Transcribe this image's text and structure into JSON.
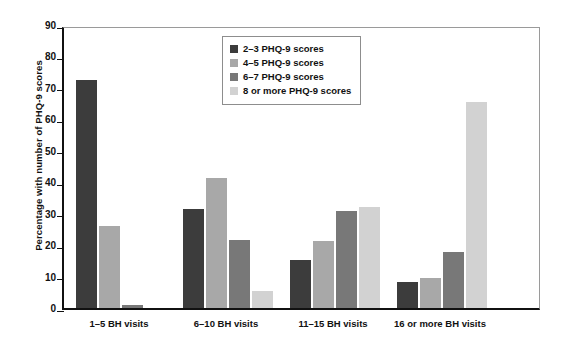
{
  "chart_data": {
    "type": "bar",
    "title": "",
    "xlabel": "",
    "ylabel": "Percentage with number of PHQ-9 scores",
    "ylim": [
      0,
      90
    ],
    "ytick_step": 10,
    "yticks": [
      "0",
      "10",
      "20",
      "30",
      "40",
      "50",
      "60",
      "70",
      "80",
      "90"
    ],
    "grid": false,
    "legend_position": "top-center",
    "categories": [
      "1–5 BH visits",
      "6–10 BH visits",
      "11–15 BH visits",
      "16 or more BH visits"
    ],
    "series": [
      {
        "name": "2–3 PHQ-9 scores",
        "color": "#3c3c3c",
        "values": [
          72.5,
          31.5,
          15.3,
          8.2
        ]
      },
      {
        "name": "4–5 PHQ-9 scores",
        "color": "#a8a8a8",
        "values": [
          26.0,
          41.5,
          21.2,
          9.7
        ]
      },
      {
        "name": "6–7 PHQ-9 scores",
        "color": "#787878",
        "values": [
          1.0,
          21.5,
          31.0,
          17.7
        ]
      },
      {
        "name": "8 or more  PHQ-9 scores",
        "color": "#d2d2d2",
        "values": [
          0.0,
          5.5,
          32.2,
          65.5
        ]
      }
    ]
  },
  "colors": {
    "axis": "#111111",
    "frame": "#9a9a9a",
    "background": "#ffffff"
  }
}
